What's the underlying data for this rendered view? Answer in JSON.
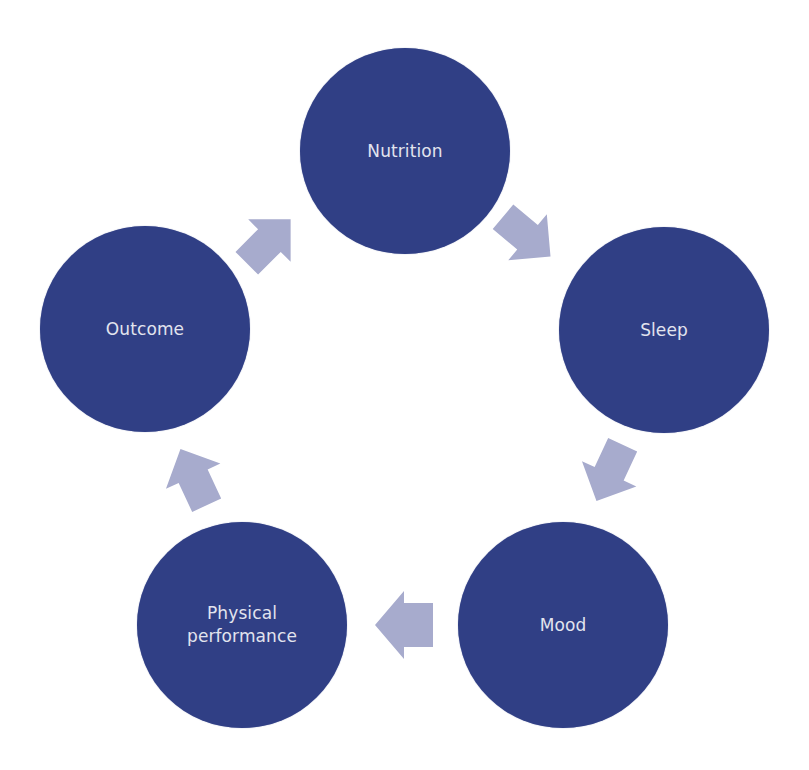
{
  "diagram": {
    "type": "cycle",
    "colors": {
      "node_fill": "#303f85",
      "node_text": "#e2e4ee",
      "arrow_fill": "#a7abcd",
      "background": "#ffffff"
    },
    "nodes": [
      {
        "id": "nutrition",
        "label": "Nutrition"
      },
      {
        "id": "sleep",
        "label": "Sleep"
      },
      {
        "id": "mood",
        "label": "Mood"
      },
      {
        "id": "physical_performance",
        "label": "Physical performance"
      },
      {
        "id": "outcome",
        "label": "Outcome"
      }
    ],
    "edges": [
      {
        "from": "nutrition",
        "to": "sleep"
      },
      {
        "from": "sleep",
        "to": "mood"
      },
      {
        "from": "mood",
        "to": "physical_performance"
      },
      {
        "from": "physical_performance",
        "to": "outcome"
      },
      {
        "from": "outcome",
        "to": "nutrition"
      }
    ]
  }
}
